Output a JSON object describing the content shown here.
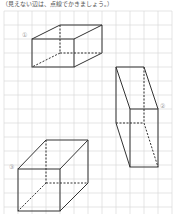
{
  "instruction": "（見えない辺は、点線でかきましょう。）",
  "labels": {
    "shape1": "①",
    "shape2": "②",
    "shape3": "③"
  },
  "colors": {
    "grid": "#d0d0d0",
    "line": "#333333",
    "label": "#999999"
  }
}
